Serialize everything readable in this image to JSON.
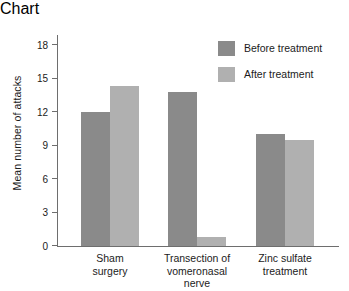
{
  "chart_data": {
    "type": "bar",
    "title": "",
    "xlabel": "",
    "ylabel": "Mean number of attacks",
    "ylim": [
      0,
      19
    ],
    "yticks": [
      0,
      3,
      6,
      9,
      12,
      15,
      18
    ],
    "ytick_labels": [
      "0",
      "3",
      "6",
      "9",
      "12",
      "15",
      "18"
    ],
    "grid": false,
    "legend_position": "top-right",
    "categories": [
      "Sham surgery",
      "Transection of vomeronasal nerve",
      "Zinc sulfate treatment"
    ],
    "category_lines": [
      [
        "Sham",
        "surgery"
      ],
      [
        "Transection of",
        "vomeronasal",
        "nerve"
      ],
      [
        "Zinc sulfate",
        "treatment"
      ]
    ],
    "series": [
      {
        "name": "Before treatment",
        "color": "#8a8a8a",
        "values": [
          12.0,
          13.8,
          10.0
        ]
      },
      {
        "name": "After treatment",
        "color": "#b0b0b0",
        "values": [
          14.3,
          0.8,
          9.5
        ]
      }
    ]
  },
  "legend": {
    "items": [
      {
        "label": "Before treatment",
        "color": "#8a8a8a"
      },
      {
        "label": "After treatment",
        "color": "#b0b0b0"
      }
    ]
  },
  "axis": {
    "y_label": "Mean number of attacks",
    "tick_0": "0",
    "tick_1": "3",
    "tick_2": "6",
    "tick_3": "9",
    "tick_4": "12",
    "tick_5": "15",
    "tick_6": "18"
  },
  "colors": {
    "before": "#8a8a8a",
    "after": "#b0b0b0",
    "axis": "#6e6e6e",
    "text": "#1b1b1b",
    "background": "#ffffff"
  }
}
